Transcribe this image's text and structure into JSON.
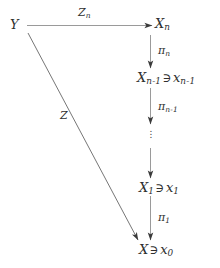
{
  "diagram": {
    "type": "commutative-diagram",
    "background_color": "#ffffff",
    "ink_color": "#2f2f2f",
    "nodes": [
      {
        "id": "Y",
        "base": "Y",
        "sub": "",
        "member": "",
        "member_base": "",
        "member_sub": ""
      },
      {
        "id": "Xn",
        "base": "X",
        "sub": "n",
        "member": "",
        "member_base": "",
        "member_sub": ""
      },
      {
        "id": "Xn1",
        "base": "X",
        "sub": "n-1",
        "member": "∋",
        "member_base": "x",
        "member_sub": "n-1"
      },
      {
        "id": "X1",
        "base": "X",
        "sub": "1",
        "member": "∋",
        "member_base": "x",
        "member_sub": "1"
      },
      {
        "id": "X0",
        "base": "X",
        "sub": "",
        "member": "∋",
        "member_base": "x",
        "member_sub": "0"
      }
    ],
    "edges": [
      {
        "id": "Zn",
        "label_base": "Z",
        "label_sub": "n",
        "from": "Y",
        "to": "Xn",
        "style": "solid",
        "direction": "right"
      },
      {
        "id": "Z",
        "label_base": "Z",
        "label_sub": "",
        "from": "Y",
        "to": "X0",
        "style": "solid",
        "direction": "diagonal-down-right"
      },
      {
        "id": "pin",
        "label_base": "π",
        "label_sub": "n",
        "from": "Xn",
        "to": "Xn1",
        "style": "solid",
        "direction": "down"
      },
      {
        "id": "pin1",
        "label_base": "π",
        "label_sub": "n-1",
        "from": "Xn1",
        "to": "dots",
        "style": "solid",
        "direction": "down"
      },
      {
        "id": "pi1",
        "label_base": "π",
        "label_sub": "1",
        "from": "X1",
        "to": "X0",
        "style": "solid",
        "direction": "down"
      }
    ],
    "ellipsis": "⋮"
  }
}
